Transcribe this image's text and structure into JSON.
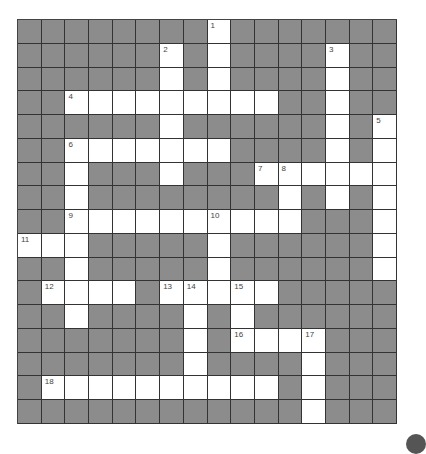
{
  "puzzle": {
    "rows": 17,
    "cols": 16,
    "colors": {
      "block": "#8c8c8c",
      "open": "#ffffff",
      "line": "#333333",
      "number": "#444444"
    },
    "open_cells": [
      [
        0,
        8
      ],
      [
        1,
        6
      ],
      [
        1,
        8
      ],
      [
        1,
        13
      ],
      [
        2,
        6
      ],
      [
        2,
        8
      ],
      [
        2,
        13
      ],
      [
        3,
        2
      ],
      [
        3,
        3
      ],
      [
        3,
        4
      ],
      [
        3,
        5
      ],
      [
        3,
        6
      ],
      [
        3,
        7
      ],
      [
        3,
        8
      ],
      [
        3,
        9
      ],
      [
        3,
        10
      ],
      [
        3,
        13
      ],
      [
        4,
        6
      ],
      [
        4,
        13
      ],
      [
        4,
        15
      ],
      [
        5,
        2
      ],
      [
        5,
        3
      ],
      [
        5,
        4
      ],
      [
        5,
        5
      ],
      [
        5,
        6
      ],
      [
        5,
        7
      ],
      [
        5,
        8
      ],
      [
        5,
        13
      ],
      [
        5,
        15
      ],
      [
        6,
        2
      ],
      [
        6,
        6
      ],
      [
        6,
        10
      ],
      [
        6,
        11
      ],
      [
        6,
        12
      ],
      [
        6,
        13
      ],
      [
        6,
        14
      ],
      [
        6,
        15
      ],
      [
        7,
        2
      ],
      [
        7,
        11
      ],
      [
        7,
        13
      ],
      [
        7,
        15
      ],
      [
        8,
        2
      ],
      [
        8,
        3
      ],
      [
        8,
        4
      ],
      [
        8,
        5
      ],
      [
        8,
        6
      ],
      [
        8,
        7
      ],
      [
        8,
        8
      ],
      [
        8,
        9
      ],
      [
        8,
        10
      ],
      [
        8,
        11
      ],
      [
        8,
        15
      ],
      [
        9,
        0
      ],
      [
        9,
        1
      ],
      [
        9,
        2
      ],
      [
        9,
        8
      ],
      [
        9,
        15
      ],
      [
        10,
        2
      ],
      [
        10,
        8
      ],
      [
        10,
        15
      ],
      [
        11,
        1
      ],
      [
        11,
        2
      ],
      [
        11,
        3
      ],
      [
        11,
        4
      ],
      [
        11,
        6
      ],
      [
        11,
        7
      ],
      [
        11,
        8
      ],
      [
        11,
        9
      ],
      [
        11,
        10
      ],
      [
        12,
        2
      ],
      [
        12,
        7
      ],
      [
        12,
        9
      ],
      [
        13,
        7
      ],
      [
        13,
        9
      ],
      [
        13,
        10
      ],
      [
        13,
        11
      ],
      [
        13,
        12
      ],
      [
        14,
        7
      ],
      [
        14,
        12
      ],
      [
        15,
        1
      ],
      [
        15,
        2
      ],
      [
        15,
        3
      ],
      [
        15,
        4
      ],
      [
        15,
        5
      ],
      [
        15,
        6
      ],
      [
        15,
        7
      ],
      [
        15,
        8
      ],
      [
        15,
        9
      ],
      [
        15,
        10
      ],
      [
        15,
        12
      ],
      [
        16,
        12
      ]
    ],
    "numbers": [
      {
        "r": 0,
        "c": 8,
        "n": "1"
      },
      {
        "r": 1,
        "c": 6,
        "n": "2"
      },
      {
        "r": 1,
        "c": 13,
        "n": "3"
      },
      {
        "r": 3,
        "c": 2,
        "n": "4"
      },
      {
        "r": 4,
        "c": 15,
        "n": "5"
      },
      {
        "r": 5,
        "c": 2,
        "n": "6"
      },
      {
        "r": 6,
        "c": 10,
        "n": "7"
      },
      {
        "r": 6,
        "c": 11,
        "n": "8"
      },
      {
        "r": 8,
        "c": 2,
        "n": "9"
      },
      {
        "r": 8,
        "c": 8,
        "n": "10"
      },
      {
        "r": 9,
        "c": 0,
        "n": "11"
      },
      {
        "r": 11,
        "c": 1,
        "n": "12"
      },
      {
        "r": 11,
        "c": 6,
        "n": "13"
      },
      {
        "r": 11,
        "c": 7,
        "n": "14"
      },
      {
        "r": 11,
        "c": 9,
        "n": "15"
      },
      {
        "r": 13,
        "c": 9,
        "n": "16"
      },
      {
        "r": 13,
        "c": 12,
        "n": "17"
      },
      {
        "r": 15,
        "c": 1,
        "n": "18"
      }
    ]
  },
  "icons": {
    "corner": "dark-circle-icon"
  }
}
